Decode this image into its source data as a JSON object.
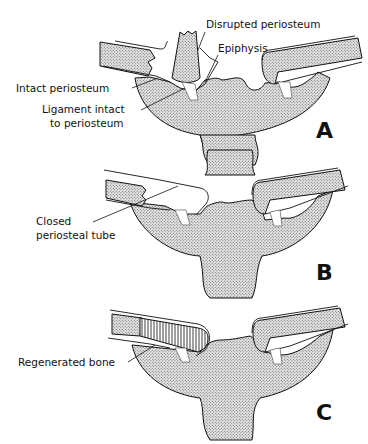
{
  "figure": {
    "panels": [
      {
        "letter": "A",
        "labels": {
          "disrupted_periosteum": "Disrupted periosteum",
          "epiphysis": "Epiphysis",
          "intact_periosteum": "Intact periosteum",
          "ligament_line1": "Ligament intact",
          "ligament_line2": "to periosteum"
        }
      },
      {
        "letter": "B",
        "labels": {
          "closed_line1": "Closed",
          "closed_line2": "periosteal tube"
        }
      },
      {
        "letter": "C",
        "labels": {
          "regenerated_bone": "Regenerated bone"
        }
      }
    ]
  }
}
